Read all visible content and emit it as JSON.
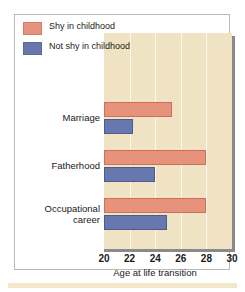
{
  "chart_data": {
    "type": "bar",
    "orientation": "horizontal",
    "title": "",
    "xlabel": "Age at life transition",
    "ylabel": "",
    "xlim": [
      20,
      30
    ],
    "xticks": [
      20,
      22,
      24,
      26,
      28,
      30
    ],
    "grid": true,
    "grid_axis": "x",
    "legend_position": "top-right-inside",
    "categories": [
      "Marriage",
      "Fatherhood",
      "Occupational career"
    ],
    "category_labels": [
      [
        "Marriage"
      ],
      [
        "Fatherhood"
      ],
      [
        "Occupational",
        "career"
      ]
    ],
    "series": [
      {
        "name": "Shy in childhood",
        "color": "#e8917b",
        "values": [
          25.3,
          28.0,
          28.0
        ]
      },
      {
        "name": "Not shy in childhood",
        "color": "#6878ae",
        "values": [
          22.3,
          24.0,
          24.9
        ]
      }
    ]
  },
  "legend": {
    "entries": [
      {
        "label": "Shy in childhood",
        "color": "#e8917b"
      },
      {
        "label": "Not shy in childhood",
        "color": "#6878ae"
      }
    ]
  },
  "colors": {
    "panel_background": "#f0e3c4",
    "gridline": "#fdf7e8",
    "shadow": "#8a8a8a",
    "frame": "#b9b9b9",
    "text": "#1a1a1a",
    "bottom_strip": "#f2e7c9"
  }
}
